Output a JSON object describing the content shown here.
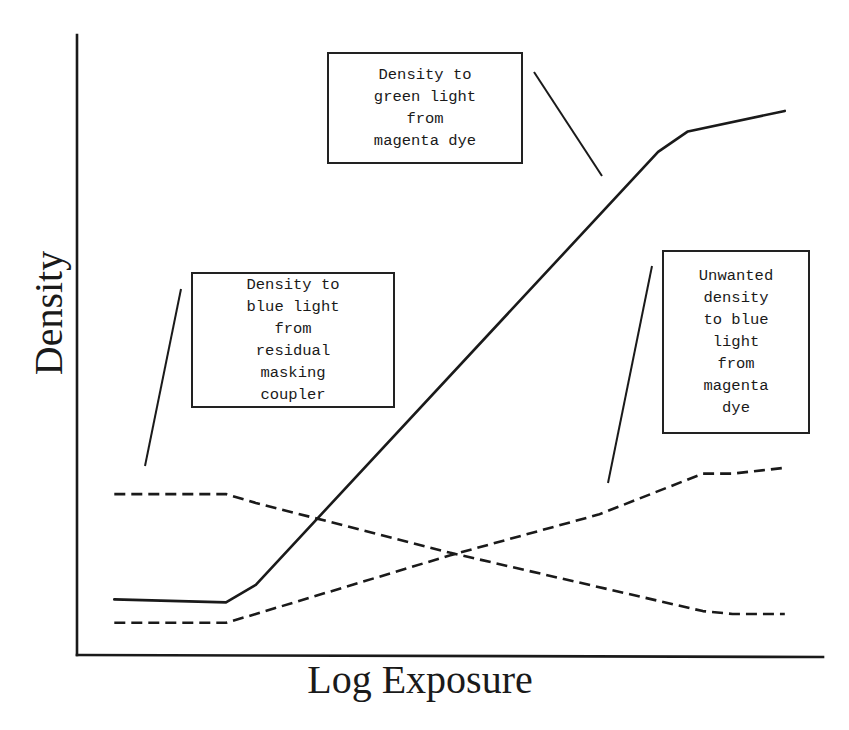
{
  "chart_data": {
    "type": "line",
    "title": "",
    "xlabel": "Log Exposure",
    "ylabel": "Density",
    "grid": false,
    "ticks": "none",
    "legend": "annotations with leader lines",
    "xlim": [
      0,
      10
    ],
    "ylim": [
      0,
      10
    ],
    "series": [
      {
        "name": "Density to green light from magenta dye",
        "style": "solid",
        "x": [
          0.5,
          2.0,
          2.4,
          7.8,
          8.2,
          9.5
        ],
        "y": [
          0.95,
          0.9,
          1.2,
          8.6,
          8.95,
          9.3
        ]
      },
      {
        "name": "Density to blue light from residual masking coupler",
        "style": "dashed",
        "x": [
          0.5,
          2.0,
          2.4,
          5.0,
          8.4,
          8.8,
          9.5
        ],
        "y": [
          2.75,
          2.75,
          2.6,
          1.75,
          0.75,
          0.7,
          0.7
        ]
      },
      {
        "name": "Unwanted density to blue light from magenta dye",
        "style": "dashed",
        "x": [
          0.5,
          2.0,
          2.4,
          5.0,
          7.0,
          8.4,
          8.8,
          9.5
        ],
        "y": [
          0.55,
          0.55,
          0.7,
          1.7,
          2.4,
          3.1,
          3.1,
          3.2
        ]
      }
    ],
    "annotations": [
      {
        "text": [
          "Density to",
          "green light",
          "from",
          "magenta dye"
        ],
        "points_to": "Density to green light from magenta dye"
      },
      {
        "text": [
          "Density to",
          "blue light",
          "from",
          "residual",
          "masking",
          "coupler"
        ],
        "points_to": "Density to blue light from residual masking coupler"
      },
      {
        "text": [
          "Unwanted",
          "density",
          "to blue",
          "light",
          "from",
          "magenta",
          "dye"
        ],
        "points_to": "Unwanted density to blue light from magenta dye"
      }
    ]
  },
  "plot": {
    "origin_px": [
      77,
      655
    ],
    "x_end_px": 823,
    "y_top_px": 35,
    "px_per_x": 74.5,
    "px_per_y": 58.5,
    "ink_color": "#1a1a1a",
    "background": "#ffffff"
  }
}
